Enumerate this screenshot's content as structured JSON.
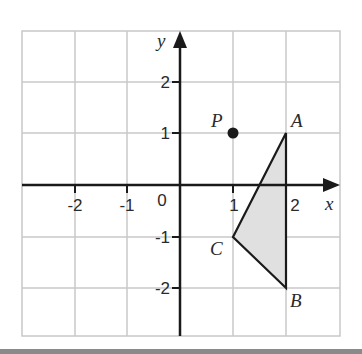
{
  "diagram": {
    "type": "coordinate-grid",
    "x_axis_label": "x",
    "y_axis_label": "y",
    "origin_label": "0",
    "x_ticks": [
      {
        "value": -2,
        "label": "-2"
      },
      {
        "value": -1,
        "label": "-1"
      },
      {
        "value": 1,
        "label": "1"
      },
      {
        "value": 2,
        "label": "2"
      }
    ],
    "y_ticks": [
      {
        "value": 2,
        "label": "2"
      },
      {
        "value": 1,
        "label": "1"
      },
      {
        "value": -1,
        "label": "-1"
      },
      {
        "value": -2,
        "label": "-2"
      }
    ],
    "x_range": [
      -3,
      3
    ],
    "y_range": [
      -3,
      3
    ],
    "points": [
      {
        "name": "P",
        "x": 1,
        "y": 1
      },
      {
        "name": "A",
        "x": 2,
        "y": 1
      },
      {
        "name": "B",
        "x": 2,
        "y": -2
      },
      {
        "name": "C",
        "x": 1,
        "y": -1
      }
    ],
    "shapes": [
      {
        "type": "triangle",
        "vertices": [
          "A",
          "B",
          "C"
        ],
        "fill": "#e0e0e0",
        "stroke": "#1a1a1a"
      }
    ],
    "colors": {
      "grid": "#c8c8c8",
      "axis": "#1a1a1a",
      "shaded": "#e0e0e0"
    }
  }
}
